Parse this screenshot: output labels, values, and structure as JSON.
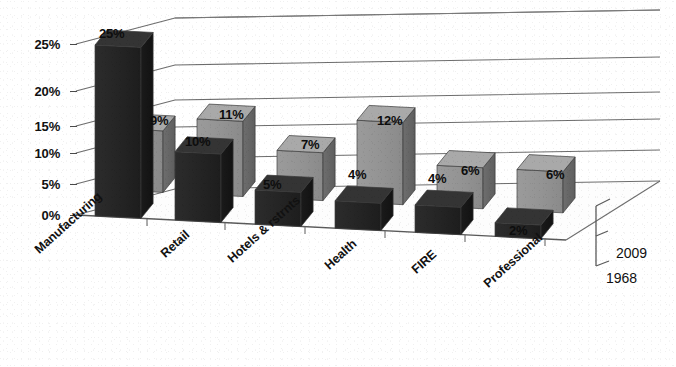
{
  "chart_data": {
    "type": "bar",
    "title": "",
    "subtitle": "",
    "xlabel": "",
    "ylabel": "",
    "categories": [
      "Manufacturing",
      "Retail",
      "Hotels & rstrnts",
      "Health",
      "FIRE",
      "Professional"
    ],
    "series": [
      {
        "name": "2009",
        "values": [
          9,
          11,
          7,
          12,
          6,
          6
        ],
        "color": "#8d8d8d"
      },
      {
        "name": "1968",
        "values": [
          25,
          10,
          5,
          4,
          4,
          2
        ],
        "color": "#262626"
      }
    ],
    "value_labels": {
      "2009": [
        "9%",
        "11%",
        "7%",
        "12%",
        "6%",
        "6%"
      ],
      "1968": [
        "25%",
        "10%",
        "5%",
        "4%",
        "4%",
        "2%"
      ]
    },
    "ytick_labels": [
      "0%",
      "5%",
      "10%",
      "15%",
      "20%",
      "25%"
    ],
    "ytick_values": [
      0,
      5,
      10,
      15,
      20,
      25
    ],
    "ylim": [
      0,
      25
    ],
    "value_suffix": "%",
    "grid": true,
    "grid_orientation": "horizontal-3d",
    "legend_position": "depth-axis-right",
    "projection": "3d"
  },
  "axes": {
    "value_axis_name": "percent-axis",
    "category_axis_name": "industry-axis",
    "depth_axis_name": "year-axis"
  }
}
